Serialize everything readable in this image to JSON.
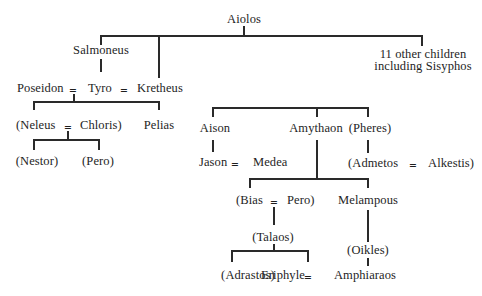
{
  "diagram": {
    "type": "genealogical-tree",
    "partial_header_text": "",
    "marriage_symbol": "=",
    "people": {
      "aiolos": "Aiolos",
      "salmoneus": "Salmoneus",
      "other_children_line1": "11 other children",
      "other_children_line2": "including Sisyphos",
      "poseidon": "Poseidon",
      "tyro": "Tyro",
      "kretheus": "Kretheus",
      "neleus": "(Neleus",
      "chloris": "Chloris)",
      "pelias": "Pelias",
      "nestor": "(Nestor)",
      "pero1": "(Pero)",
      "aison": "Aison",
      "amythaon": "Amythaon",
      "pheres": "(Pheres)",
      "jason": "Jason",
      "medea": "Medea",
      "admetos": "(Admetos",
      "alkestis": "Alkestis)",
      "bias": "(Bias",
      "pero2": "Pero)",
      "melampous": "Melampous",
      "talaos": "(Talaos)",
      "oikles": "(Oikles)",
      "adrastos": "(Adrastos)",
      "eriphyle": "Eriphyle",
      "amphiaraos": "Amphiaraos"
    },
    "relations": {
      "marriages": [
        [
          "Poseidon",
          "Tyro"
        ],
        [
          "Tyro",
          "Kretheus"
        ],
        [
          "Neleus",
          "Chloris"
        ],
        [
          "Jason",
          "Medea"
        ],
        [
          "Admetos",
          "Alkestis"
        ],
        [
          "Bias",
          "Pero"
        ],
        [
          "Eriphyle",
          "Amphiaraos"
        ]
      ],
      "children": {
        "Aiolos": [
          "Salmoneus",
          "Kretheus",
          "11 other children including Sisyphos"
        ],
        "Salmoneus": [
          "Tyro"
        ],
        "Poseidon + Tyro": [
          "Neleus",
          "Pelias"
        ],
        "Neleus + Chloris": [
          "Nestor",
          "Pero"
        ],
        "Tyro + Kretheus": [
          "Aison",
          "Amythaon",
          "Pheres"
        ],
        "Aison": [
          "Jason"
        ],
        "Amythaon": [
          "Bias",
          "Melampous"
        ],
        "Pheres": [
          "Admetos"
        ],
        "Bias + Pero": [
          "Talaos"
        ],
        "Talaos": [
          "Adrastos",
          "Eriphyle"
        ],
        "Melampous": [
          "Oikles"
        ],
        "Oikles": [
          "Amphiaraos"
        ]
      }
    }
  }
}
